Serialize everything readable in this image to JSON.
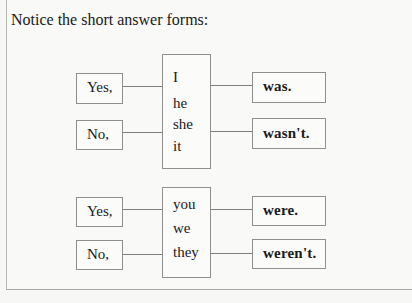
{
  "title": "Notice the short answer forms:",
  "groups": [
    {
      "yes": "Yes,",
      "no": "No,",
      "pronouns": [
        "I",
        "he",
        "she",
        "it"
      ],
      "positive": "was.",
      "negative": "wasn't."
    },
    {
      "yes": "Yes,",
      "no": "No,",
      "pronouns": [
        "you",
        "we",
        "they"
      ],
      "positive": "were.",
      "negative": "weren't."
    }
  ]
}
